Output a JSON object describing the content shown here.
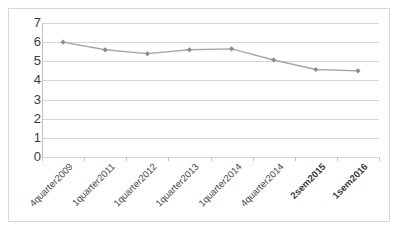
{
  "chart_data": {
    "type": "line",
    "title": "",
    "subtitle": "",
    "xlabel": "",
    "ylabel": "",
    "categories": [
      "4quarter2009",
      "1quarter2011",
      "1quarter2012",
      "1quarter2013",
      "1quarter2014",
      "4quarter2014",
      "2sem2015",
      "1sem2016"
    ],
    "values": [
      6.0,
      5.6,
      5.4,
      5.6,
      5.65,
      5.07,
      4.57,
      4.5
    ],
    "series": [
      {
        "name": "",
        "values": [
          6.0,
          5.6,
          5.4,
          5.6,
          5.65,
          5.07,
          4.57,
          4.5
        ]
      }
    ],
    "ylim": [
      0,
      7
    ],
    "yticks": [
      0,
      1,
      2,
      3,
      4,
      5,
      6,
      7
    ],
    "ytick_labels": [
      "0",
      "1",
      "2",
      "3",
      "4",
      "5",
      "6",
      "7"
    ],
    "grid": true,
    "grid_axis": "y",
    "legend": false,
    "legend_position": "none",
    "marker": "diamond",
    "line_color": "#a6a6a6",
    "marker_color": "#8c8c8c",
    "grid_color": "#d6d6d6",
    "axis_color": "#bfbfbf",
    "background_color": "#ffffff",
    "border_color": "#d9d9d9",
    "bold_categories": [
      "2sem2015",
      "1sem2016"
    ]
  }
}
